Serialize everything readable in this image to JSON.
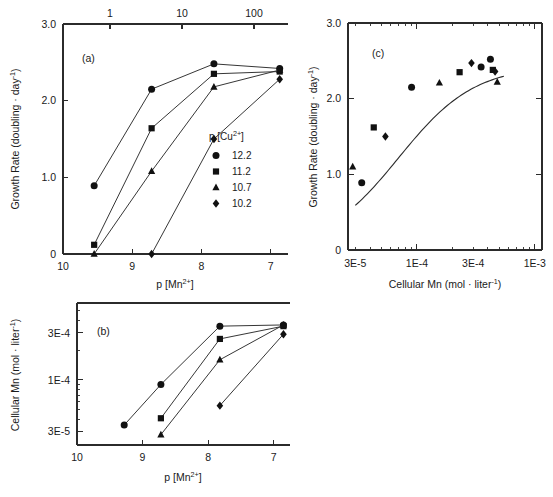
{
  "figure": {
    "background": "#ffffff",
    "ink_color": "#1a1a1a",
    "marker_color": "#111111"
  },
  "panels": {
    "a": {
      "label": "(a)",
      "ylabel": "Growth Rate (doubling · day",
      "ylabel_sup": "-1",
      "ylabel_tail": ")",
      "xlabel": "p [Mn",
      "xlabel_sup": "2+",
      "xlabel_tail": "]",
      "y_ticks": [
        "0",
        "1.0",
        "2.0",
        "3.0"
      ],
      "x_ticks": [
        "10",
        "9",
        "8",
        "7"
      ],
      "top_ticks": [
        "1",
        "10",
        "100"
      ],
      "legend": {
        "title": "p [Cu",
        "title_sup": "2+",
        "title_tail": "]",
        "entries": [
          {
            "marker": "circle",
            "label": "12.2"
          },
          {
            "marker": "square",
            "label": "11.2"
          },
          {
            "marker": "triangle",
            "label": "10.7"
          },
          {
            "marker": "diamond",
            "label": "10.2"
          }
        ]
      }
    },
    "b": {
      "label": "(b)",
      "ylabel": "Cellular Mn (mol · liter",
      "ylabel_sup": "-1",
      "ylabel_tail": ")",
      "xlabel": "p [Mn",
      "xlabel_sup": "2+",
      "xlabel_tail": "]",
      "y_ticks": [
        "3E-5",
        "1E-4",
        "3E-4"
      ],
      "x_ticks": [
        "10",
        "9",
        "8",
        "7"
      ]
    },
    "c": {
      "label": "(c)",
      "ylabel": "Growth Rate (doubling · day",
      "ylabel_sup": "-1",
      "ylabel_tail": ")",
      "xlabel": "Cellular Mn (mol · liter",
      "xlabel_sup": "-1",
      "xlabel_tail": ")",
      "y_ticks": [
        "0",
        "1.0",
        "2.0",
        "3.0"
      ],
      "x_ticks": [
        "3E-5",
        "1E-4",
        "3E-4",
        "1E-3"
      ]
    }
  },
  "chart_data": [
    {
      "type": "line",
      "panel": "a",
      "title": "(a)",
      "xlabel": "p [Mn2+]",
      "ylabel": "Growth Rate (doubling · day-1)",
      "xlim": [
        10,
        6.75
      ],
      "ylim": [
        0,
        3.0
      ],
      "x_reversed": true,
      "grid": false,
      "top_axis": {
        "label": "",
        "ticks": [
          1,
          10,
          100
        ],
        "scale": "log"
      },
      "legend": {
        "title": "p [Cu2+]",
        "position": "inside-lower-right"
      },
      "series": [
        {
          "name": "12.2",
          "marker": "circle",
          "points": [
            {
              "x": 9.55,
              "y": 0.89
            },
            {
              "x": 8.72,
              "y": 2.15
            },
            {
              "x": 7.82,
              "y": 2.48
            },
            {
              "x": 6.87,
              "y": 2.42
            }
          ]
        },
        {
          "name": "11.2",
          "marker": "square",
          "points": [
            {
              "x": 9.55,
              "y": 0.12
            },
            {
              "x": 8.72,
              "y": 1.64
            },
            {
              "x": 7.82,
              "y": 2.35
            },
            {
              "x": 6.87,
              "y": 2.38
            }
          ]
        },
        {
          "name": "10.7",
          "marker": "triangle",
          "points": [
            {
              "x": 9.55,
              "y": 0.0
            },
            {
              "x": 8.72,
              "y": 1.08
            },
            {
              "x": 7.82,
              "y": 2.18
            },
            {
              "x": 6.87,
              "y": 2.4
            }
          ]
        },
        {
          "name": "10.2",
          "marker": "diamond",
          "points": [
            {
              "x": 8.72,
              "y": 0.0
            },
            {
              "x": 7.82,
              "y": 1.5
            },
            {
              "x": 6.87,
              "y": 2.28
            }
          ]
        }
      ]
    },
    {
      "type": "line",
      "panel": "b",
      "title": "(b)",
      "xlabel": "p [Mn2+]",
      "ylabel": "Cellular Mn (mol · liter-1)",
      "xlim": [
        10,
        6.75
      ],
      "ylim": [
        2.2e-05,
        0.0006
      ],
      "yscale": "log",
      "x_reversed": true,
      "grid": false,
      "series": [
        {
          "name": "12.2",
          "marker": "circle",
          "points": [
            {
              "x": 9.28,
              "y": 3.5e-05
            },
            {
              "x": 8.72,
              "y": 9e-05
            },
            {
              "x": 7.82,
              "y": 0.00035
            },
            {
              "x": 6.85,
              "y": 0.00036
            }
          ]
        },
        {
          "name": "11.2",
          "marker": "square",
          "points": [
            {
              "x": 8.72,
              "y": 4.1e-05
            },
            {
              "x": 7.82,
              "y": 0.00026
            },
            {
              "x": 6.85,
              "y": 0.00035
            }
          ]
        },
        {
          "name": "10.7",
          "marker": "triangle",
          "points": [
            {
              "x": 8.72,
              "y": 2.8e-05
            },
            {
              "x": 7.82,
              "y": 0.00016
            },
            {
              "x": 6.85,
              "y": 0.00036
            }
          ]
        },
        {
          "name": "10.2",
          "marker": "diamond",
          "points": [
            {
              "x": 7.82,
              "y": 5.5e-05
            },
            {
              "x": 6.85,
              "y": 0.00029
            }
          ]
        }
      ]
    },
    {
      "type": "scatter",
      "panel": "c",
      "title": "(c)",
      "xlabel": "Cellular Mn (mol · liter-1)",
      "ylabel": "Growth Rate (doubling · day-1)",
      "xlim": [
        2.6e-05,
        0.00115
      ],
      "ylim": [
        0,
        3.0
      ],
      "xscale": "log",
      "grid": false,
      "fit_curve": "saturating",
      "points": [
        {
          "x": 2.85e-05,
          "y": 1.1,
          "marker": "triangle"
        },
        {
          "x": 3.4e-05,
          "y": 0.89,
          "marker": "circle"
        },
        {
          "x": 4.3e-05,
          "y": 1.62,
          "marker": "square"
        },
        {
          "x": 5.4e-05,
          "y": 1.5,
          "marker": "diamond"
        },
        {
          "x": 9e-05,
          "y": 2.15,
          "marker": "circle"
        },
        {
          "x": 0.000155,
          "y": 2.21,
          "marker": "triangle"
        },
        {
          "x": 0.00023,
          "y": 2.35,
          "marker": "square"
        },
        {
          "x": 0.00029,
          "y": 2.47,
          "marker": "diamond"
        },
        {
          "x": 0.00035,
          "y": 2.42,
          "marker": "circle"
        },
        {
          "x": 0.00042,
          "y": 2.52,
          "marker": "circle"
        },
        {
          "x": 0.00044,
          "y": 2.38,
          "marker": "square"
        },
        {
          "x": 0.00046,
          "y": 2.36,
          "marker": "diamond"
        },
        {
          "x": 0.00048,
          "y": 2.22,
          "marker": "triangle"
        }
      ]
    }
  ]
}
